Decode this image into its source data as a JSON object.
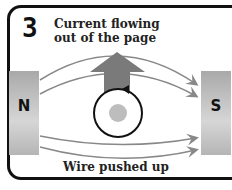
{
  "step_number": "3",
  "title_line1": "Current flowing",
  "title_line2": "out of the page",
  "magnet_left": "N",
  "magnet_right": "S",
  "caption": "Wire pushed up",
  "colors": {
    "border": "#111111",
    "magnet": "#b8b8b8",
    "field_lines": "#888888",
    "force_arrow": "#7a7a7a",
    "wire_dot": "#bdbdbd"
  }
}
